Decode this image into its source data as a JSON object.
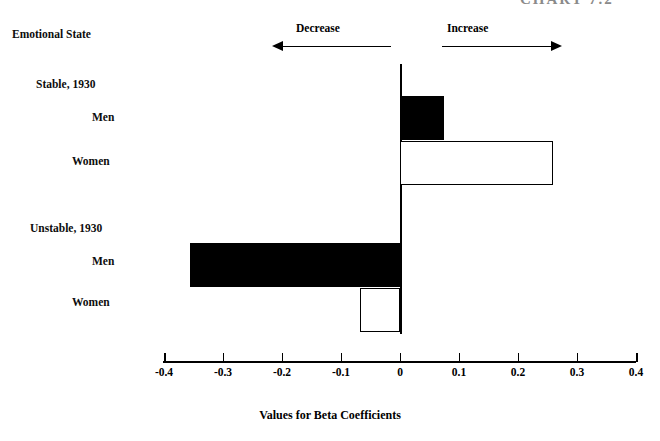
{
  "caption": "CHART 7.2",
  "axis_title_left": "Emotional State",
  "legend": {
    "decrease_label": "Decrease",
    "increase_label": "Increase"
  },
  "categories": [
    {
      "label": "Stable, 1930",
      "type": "group"
    },
    {
      "label": "Men",
      "type": "item"
    },
    {
      "label": "Women",
      "type": "item"
    },
    {
      "label": "Unstable, 1930",
      "type": "group"
    },
    {
      "label": "Men",
      "type": "item"
    },
    {
      "label": "Women",
      "type": "item"
    }
  ],
  "axis": {
    "title": "Values for Beta Coefficients",
    "ticks": [
      "-0.4",
      "-0.3",
      "-0.2",
      "-0.1",
      "0",
      "0.1",
      "0.2",
      "0.3",
      "0.4"
    ],
    "min": -0.4,
    "max": 0.4
  },
  "bars": [
    {
      "name": "stable-men",
      "value": 0.075,
      "fill": "filled"
    },
    {
      "name": "stable-women",
      "value": 0.26,
      "fill": "hollow"
    },
    {
      "name": "unstable-men",
      "value": -0.356,
      "fill": "filled"
    },
    {
      "name": "unstable-women",
      "value": -0.068,
      "fill": "hollow"
    }
  ],
  "chart_data": {
    "type": "bar",
    "orientation": "horizontal",
    "title": "CHART 7.2",
    "xlabel": "Values for Beta Coefficients",
    "ylabel": "Emotional State",
    "xlim": [
      -0.4,
      0.4
    ],
    "xticks": [
      -0.4,
      -0.3,
      -0.2,
      -0.1,
      0,
      0.1,
      0.2,
      0.3,
      0.4
    ],
    "xticklabels": [
      "-0.4",
      "-0.3",
      "-0.2",
      "-0.1",
      "0",
      "0.1",
      "0.2",
      "0.3",
      "0.4"
    ],
    "grid": false,
    "legend": [
      "Decrease",
      "Increase"
    ],
    "legend_position": "top",
    "group_labels": [
      "Stable, 1930",
      "Unstable, 1930"
    ],
    "categories": [
      "Stable, 1930 - Men",
      "Stable, 1930 - Women",
      "Unstable, 1930 - Men",
      "Unstable, 1930 - Women"
    ],
    "values": [
      0.075,
      0.26,
      -0.356,
      -0.068
    ],
    "bar_fills": [
      "black",
      "white",
      "black",
      "white"
    ],
    "annotations": [
      "Decrease arrow points left from 0",
      "Increase arrow points right from 0"
    ]
  }
}
